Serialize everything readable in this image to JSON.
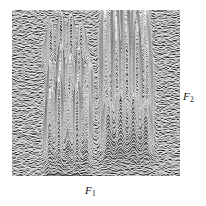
{
  "figure": {
    "kind": "2d-nmr-stacked-plot",
    "background_color": "#8d8d8d",
    "trace_color": "#ffffff",
    "shadow_color": "#0a0a0a",
    "label_color": "#141414"
  },
  "axes": {
    "horizontal": {
      "name": "F1",
      "letter": "F",
      "subscript": "1"
    },
    "vertical": {
      "name": "F2",
      "letter": "F",
      "subscript": "2"
    }
  },
  "chart_data": {
    "type": "line",
    "title": "",
    "xlabel": "F1",
    "ylabel": "F2",
    "grid": false,
    "legend": null,
    "xlim": [
      0,
      168
    ],
    "ylim": [
      0,
      166
    ],
    "n_traces": 150,
    "noise_amplitude": 2.2,
    "clusters": [
      {
        "name": "top-left",
        "cx": 54,
        "cy": 46,
        "width": 42,
        "height": 26,
        "peaks": [
          0.62,
          0.78,
          0.72,
          0.58
        ],
        "row": 1,
        "col": 1
      },
      {
        "name": "top-right",
        "cx": 113,
        "cy": 42,
        "width": 50,
        "height": 58,
        "peaks": [
          0.55,
          0.8,
          1.0,
          0.72,
          0.5
        ],
        "row": 1,
        "col": 2
      },
      {
        "name": "middle-left",
        "cx": 58,
        "cy": 88,
        "width": 46,
        "height": 38,
        "peaks": [
          0.6,
          0.95,
          0.7,
          0.88,
          0.52
        ],
        "row": 2,
        "col": 1
      },
      {
        "name": "middle-right",
        "cx": 115,
        "cy": 88,
        "width": 52,
        "height": 52,
        "peaks": [
          0.58,
          0.92,
          0.78,
          0.95,
          0.56
        ],
        "row": 2,
        "col": 2
      },
      {
        "name": "bottom-left",
        "cx": 56,
        "cy": 128,
        "width": 46,
        "height": 38,
        "peaks": [
          0.72,
          0.95,
          0.58,
          0.86,
          0.55
        ],
        "row": 3,
        "col": 1
      },
      {
        "name": "bottom-right",
        "cx": 115,
        "cy": 132,
        "width": 50,
        "height": 26,
        "peaks": [
          0.66,
          0.8,
          0.74,
          0.62
        ],
        "row": 3,
        "col": 2
      }
    ]
  }
}
